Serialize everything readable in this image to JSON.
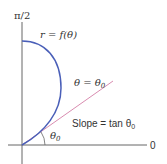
{
  "diagram": {
    "colors": {
      "axis": "#555555",
      "curve": "#4a5fb8",
      "tangent": "#d98cb0",
      "text": "#333333"
    },
    "labels": {
      "vertical_axis": "π/2",
      "horizontal_axis": "0",
      "curve": "r = f(θ)",
      "ray": "θ = θ",
      "ray_sub": "0",
      "slope": "Slope = tan θ",
      "slope_sub": "0",
      "angle": "θ",
      "angle_sub": "0"
    }
  }
}
